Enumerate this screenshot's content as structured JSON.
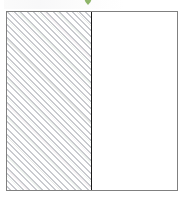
{
  "figure": {
    "caption": "",
    "frame": {
      "border_color": "#808080",
      "background_color": "#ffffff",
      "width_px": 172,
      "height_px": 180,
      "x_px": 6,
      "y_px": 11
    },
    "divider": {
      "label": "",
      "color": "#1a1a1a",
      "orientation": "vertical",
      "position_px": 91
    },
    "panels": [
      {
        "id": "left",
        "label": "",
        "fill": "diagonal-hatch",
        "hatch_angle_deg": 45,
        "hatch_spacing_px": 4,
        "hatch_color": "#b2b4ba",
        "hatch_accent_colors": [
          "#a8c6a8",
          "#cdafbe"
        ],
        "background_color": "#ffffff",
        "width_px": 85
      },
      {
        "id": "right",
        "label": "",
        "fill": "solid",
        "background_color": "#ffffff",
        "width_px": 85
      }
    ]
  },
  "ornament": {
    "name": "green-chevron-mark",
    "color": "#7aa84f",
    "description": "cut-off green chevron at top edge",
    "x_px": 78,
    "y_px": 0
  },
  "header_ghost": {
    "text": "",
    "color": "#fafafa"
  }
}
